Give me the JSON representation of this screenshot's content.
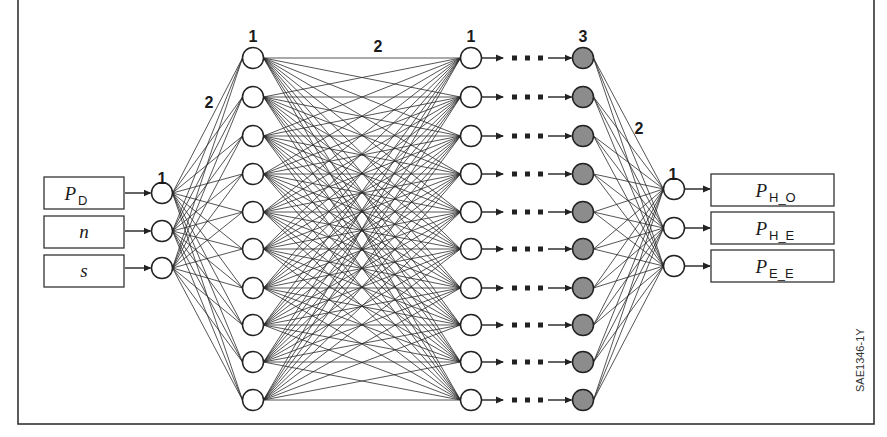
{
  "figure": {
    "id_label": "SAE1346-1Y",
    "colors": {
      "hidden_gray": "#8c8c8c",
      "stroke": "#222222",
      "background": "#ffffff"
    }
  },
  "inputs": [
    {
      "main": "P",
      "sub": "D"
    },
    {
      "main": "n",
      "sub": ""
    },
    {
      "main": "s",
      "sub": ""
    }
  ],
  "outputs": [
    {
      "main": "P",
      "sub": "H_O"
    },
    {
      "main": "P",
      "sub": "H_E"
    },
    {
      "main": "P",
      "sub": "E_E"
    }
  ],
  "layers": {
    "input_layer": {
      "label": "1",
      "node_count": 3
    },
    "hidden_layer_1": {
      "label": "1",
      "node_count": 10
    },
    "hidden_layer_2": {
      "label": "1",
      "node_count": 10
    },
    "hidden_layer_last": {
      "label": "3",
      "node_count": 10,
      "shaded": true
    },
    "output_layer": {
      "label": "1",
      "node_count": 3
    }
  },
  "connection_labels": {
    "input_to_hidden1": "2",
    "hidden1_to_hidden2": "2",
    "hiddenlast_to_output": "2"
  }
}
